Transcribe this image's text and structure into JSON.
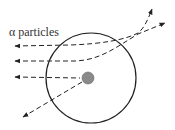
{
  "diagram": {
    "label": "α particles",
    "colors": {
      "stroke": "#222222",
      "nucleus": "#8a8a8a",
      "background": "#ffffff"
    },
    "atom": {
      "cx": 91,
      "cy": 78,
      "r": 45
    },
    "nucleus": {
      "cx": 88,
      "cy": 78,
      "r": 6
    },
    "trajectories": [
      {
        "name": "top-deflected",
        "description": "slightly deflected upward"
      },
      {
        "name": "middle-deflected",
        "description": "deflected upward more"
      },
      {
        "name": "backscattered",
        "description": "hits nucleus and bounces back"
      }
    ]
  }
}
